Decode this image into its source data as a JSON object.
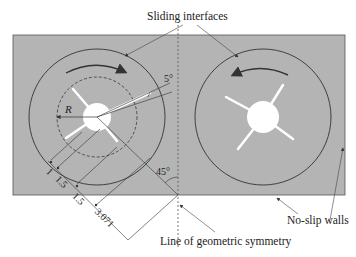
{
  "labels": {
    "sliding_interfaces": "Sliding interfaces",
    "no_slip_walls": "No-slip walls",
    "symmetry_line": "Line of geometric symmetry",
    "radius": "R",
    "angle_blade": "5°",
    "angle_diag": "45°"
  },
  "dimensions": [
    "1",
    "1.5",
    "1.5",
    "3.071"
  ],
  "colors": {
    "domain_fill": "#b4b4b4",
    "line": "#3a3a3a",
    "hub": "#ffffff"
  },
  "rotors": [
    {
      "name": "left",
      "rotation": "clockwise",
      "blades": 4
    },
    {
      "name": "right",
      "rotation": "counter-clockwise",
      "blades": 4
    }
  ]
}
